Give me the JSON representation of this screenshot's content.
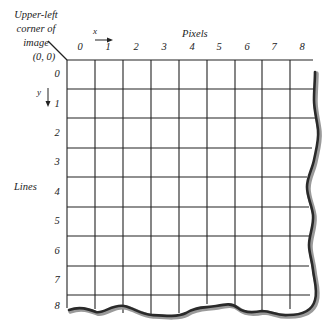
{
  "diagram": {
    "type": "image-coordinate-grid",
    "annotation": {
      "lines": [
        "Upper-left",
        "corner of",
        "image"
      ]
    },
    "origin_label": "(0, 0)",
    "x_axis": {
      "title": "Pixels",
      "variable": "x",
      "direction": "right",
      "ticks": [
        "0",
        "1",
        "2",
        "3",
        "4",
        "5",
        "6",
        "7",
        "8"
      ]
    },
    "y_axis": {
      "title": "Lines",
      "variable": "y",
      "direction": "down",
      "ticks": [
        "0",
        "1",
        "2",
        "3",
        "4",
        "5",
        "6",
        "7",
        "8"
      ]
    },
    "grid": {
      "columns": 9,
      "rows": 9,
      "edges": "right and bottom edges torn (wavy), indicating the image continues"
    },
    "colors": {
      "line": "#222222",
      "torn_edge": "#333333",
      "torn_shadow": "#9a9a9a",
      "background": "#ffffff"
    }
  }
}
